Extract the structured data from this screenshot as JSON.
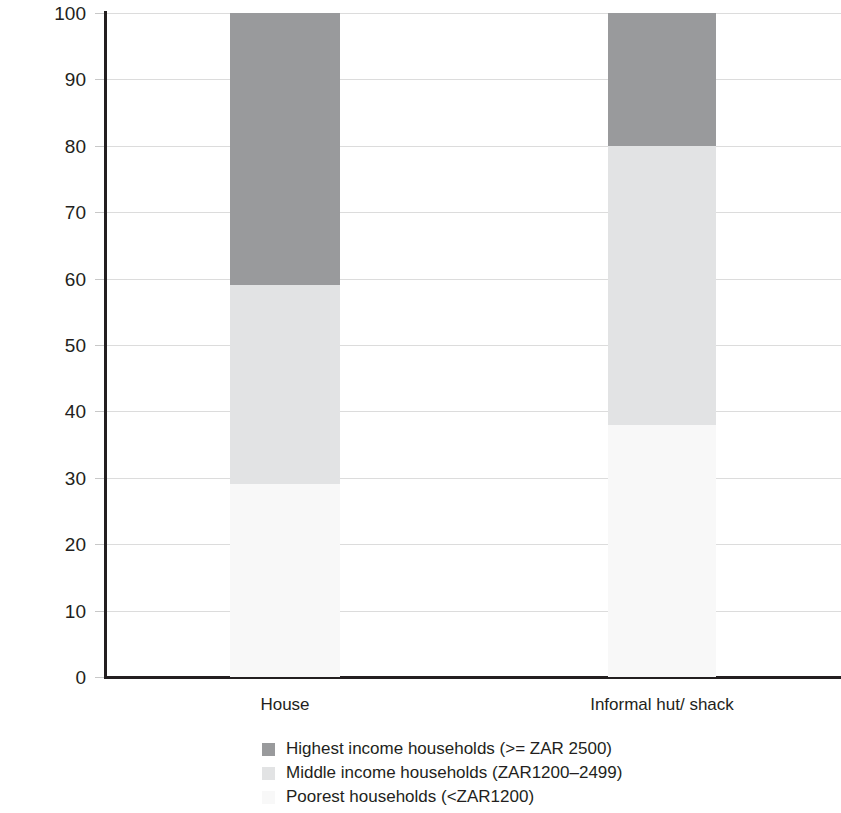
{
  "chart_data": {
    "type": "bar",
    "subtype": "stacked-100-percent",
    "title": "",
    "xlabel": "",
    "ylabel": "Percentage of households",
    "categories": [
      "House",
      "Informal hut/ shack"
    ],
    "ylim": [
      0,
      100
    ],
    "ytick_values": [
      0,
      10,
      20,
      30,
      40,
      50,
      60,
      70,
      80,
      90,
      100
    ],
    "ytick_labels": [
      "0",
      "10",
      "20",
      "30",
      "40",
      "50",
      "60",
      "70",
      "80",
      "90",
      "100"
    ],
    "grid": true,
    "legend_position": "bottom",
    "series": [
      {
        "name": "Highest income households (>= ZAR 2500)",
        "color": "#999a9c",
        "values": [
          41,
          20
        ]
      },
      {
        "name": "Middle income households (ZAR1200–2499)",
        "color": "#e2e3e4",
        "values": [
          30,
          42
        ]
      },
      {
        "name": "Poorest households (<ZAR1200)",
        "color": "#f8f8f8",
        "values": [
          29,
          38
        ]
      }
    ],
    "stack_boundaries": [
      {
        "category": "House",
        "poorest_top": 29,
        "middle_top": 59,
        "highest_top": 100
      },
      {
        "category": "Informal hut/ shack",
        "poorest_top": 38,
        "middle_top": 80,
        "highest_top": 100
      }
    ]
  },
  "axis": {
    "y_title": "Percentage of households",
    "ticks": [
      {
        "label": "100",
        "value": 100
      },
      {
        "label": "90",
        "value": 90
      },
      {
        "label": "80",
        "value": 80
      },
      {
        "label": "70",
        "value": 70
      },
      {
        "label": "60",
        "value": 60
      },
      {
        "label": "50",
        "value": 50
      },
      {
        "label": "40",
        "value": 40
      },
      {
        "label": "30",
        "value": 30
      },
      {
        "label": "20",
        "value": 20
      },
      {
        "label": "10",
        "value": 10
      },
      {
        "label": "0",
        "value": 0
      }
    ]
  },
  "categories": [
    {
      "label": "House"
    },
    {
      "label": "Informal hut/ shack"
    }
  ],
  "legend": {
    "items": [
      {
        "label": "Highest income households (>= ZAR 2500)",
        "color": "#999a9c"
      },
      {
        "label": "Middle income households (ZAR1200–2499)",
        "color": "#e2e3e4"
      },
      {
        "label": "Poorest households (<ZAR1200)",
        "color": "#f8f8f8"
      }
    ]
  }
}
